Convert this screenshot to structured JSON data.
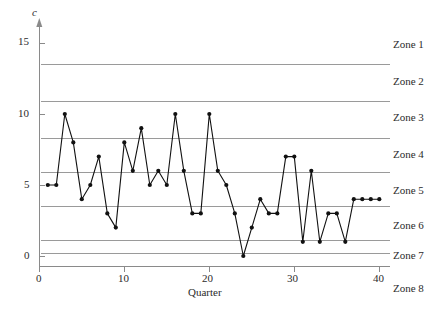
{
  "chart_data": {
    "type": "line",
    "title": "",
    "xlabel": "Quarter",
    "ylabel": "c",
    "xlim": [
      0,
      40
    ],
    "ylim": [
      -1.1,
      16.0
    ],
    "xticks": [
      0,
      10,
      20,
      30,
      40
    ],
    "yticks": [
      0,
      5,
      10,
      15
    ],
    "grid": false,
    "legend_position": "right",
    "x": [
      1,
      2,
      3,
      4,
      5,
      6,
      7,
      8,
      9,
      10,
      11,
      12,
      13,
      14,
      15,
      16,
      17,
      18,
      19,
      20,
      21,
      22,
      23,
      24,
      25,
      26,
      27,
      28,
      29,
      30,
      31,
      32,
      33,
      34,
      35,
      36,
      37,
      38,
      39,
      40
    ],
    "values": [
      5,
      5,
      10,
      8,
      4,
      5,
      7,
      3,
      2,
      8,
      6,
      9,
      5,
      6,
      5,
      10,
      6,
      3,
      3,
      10,
      6,
      5,
      3,
      0,
      2,
      4,
      3,
      3,
      7,
      7,
      1,
      6,
      1,
      3,
      3,
      1,
      4,
      4,
      4,
      4
    ],
    "series": [
      {
        "name": "c",
        "marker": "filled-circle",
        "color": "#111111",
        "values": [
          5,
          5,
          10,
          8,
          4,
          5,
          7,
          3,
          2,
          8,
          6,
          9,
          5,
          6,
          5,
          10,
          6,
          3,
          3,
          10,
          6,
          5,
          3,
          0,
          2,
          4,
          3,
          3,
          7,
          7,
          1,
          6,
          1,
          3,
          3,
          1,
          4,
          4,
          4,
          4
        ]
      }
    ],
    "zone_lines": [
      13.5,
      10.9,
      8.3,
      5.9,
      3.5,
      1.1,
      0.15
    ],
    "zone_line_color": "#9a9a9a",
    "zones": [
      {
        "label": "Zone 1"
      },
      {
        "label": "Zone 2"
      },
      {
        "label": "Zone 3"
      },
      {
        "label": "Zone 4"
      },
      {
        "label": "Zone 5"
      },
      {
        "label": "Zone 6"
      },
      {
        "label": "Zone 7"
      },
      {
        "label": "Zone 8"
      }
    ],
    "axis_color": "#8a8a8a"
  },
  "axes": {
    "y_axis_label": "c",
    "x_axis_label": "Quarter",
    "y_tick_labels": [
      "15",
      "10",
      "5",
      "0"
    ],
    "x_tick_labels": [
      "0",
      "10",
      "20",
      "30",
      "40"
    ]
  },
  "zone_labels": {
    "z1": "Zone 1",
    "z2": "Zone 2",
    "z3": "Zone 3",
    "z4": "Zone 4",
    "z5": "Zone 5",
    "z6": "Zone 6",
    "z7": "Zone 7",
    "z8": "Zone 8"
  }
}
